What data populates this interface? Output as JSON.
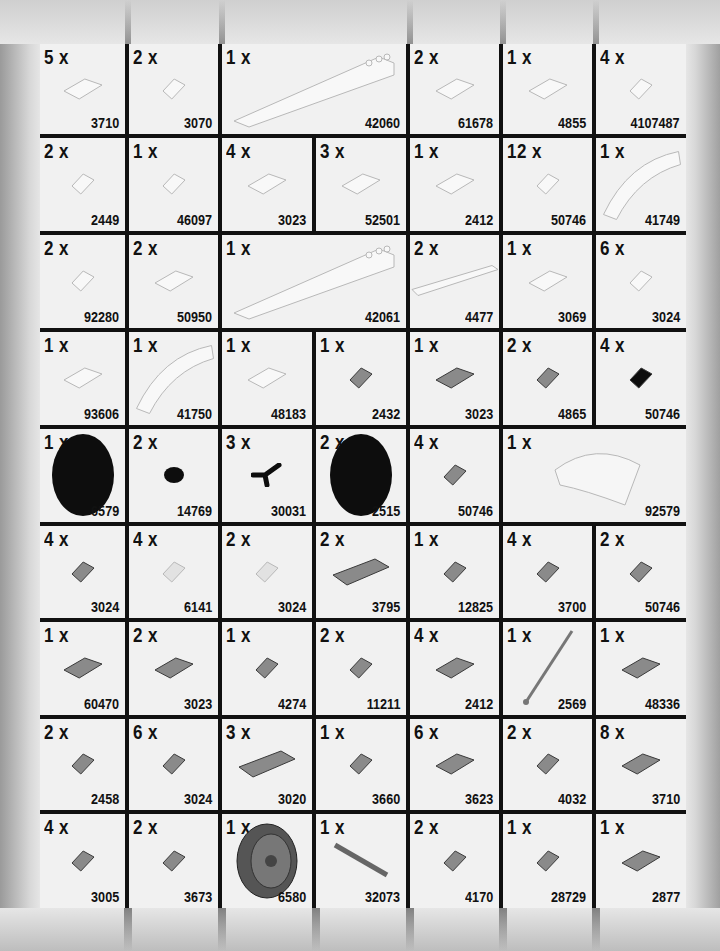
{
  "page": {
    "quantity_suffix": "x"
  },
  "colors": {
    "grid_line": "#111111",
    "cell_bg": "#f1f1f1",
    "white_part": "#f8f8f8",
    "gray_part": "#8a8a8a",
    "black_part": "#0d0d0d"
  },
  "rows": [
    {
      "cells": [
        {
          "qty": "5 x",
          "part": "3710",
          "color": "white",
          "shape": "plate-1x4",
          "span": 1
        },
        {
          "qty": "2 x",
          "part": "3070",
          "color": "white",
          "shape": "tile-1x1",
          "span": 1
        },
        {
          "qty": "1 x",
          "part": "42060",
          "color": "white",
          "shape": "wedge-long",
          "span": 2
        },
        {
          "qty": "2 x",
          "part": "61678",
          "color": "white",
          "shape": "curved-slope",
          "span": 1
        },
        {
          "qty": "1 x",
          "part": "4855",
          "color": "white",
          "shape": "wedge-inverted",
          "span": 1
        },
        {
          "qty": "4 x",
          "part": "4107487",
          "color": "white",
          "shape": "slope-small",
          "span": 1
        }
      ]
    },
    {
      "cells": [
        {
          "qty": "2 x",
          "part": "2449",
          "color": "white",
          "shape": "slope-inverted-tall",
          "span": 1
        },
        {
          "qty": "1  x",
          "part": "46097",
          "color": "white",
          "shape": "slope-printed",
          "span": 1
        },
        {
          "qty": "4 x",
          "part": "3023",
          "color": "white",
          "shape": "plate-1x2",
          "span": 1
        },
        {
          "qty": "3 x",
          "part": "52501",
          "color": "white",
          "shape": "slope-inverted-plate",
          "span": 1
        },
        {
          "qty": "1 x",
          "part": "2412",
          "color": "white",
          "shape": "grille",
          "span": 1
        },
        {
          "qty": "12 x",
          "part": "50746",
          "color": "white",
          "shape": "slope-1x1",
          "span": 1
        },
        {
          "qty": "1 x",
          "part": "41749",
          "color": "white",
          "shape": "wedge-curved",
          "span": 1
        }
      ]
    },
    {
      "cells": [
        {
          "qty": "2 x",
          "part": "92280",
          "color": "white",
          "shape": "plate-clip",
          "span": 1
        },
        {
          "qty": "2 x",
          "part": "50950",
          "color": "white",
          "shape": "curved-slope-small",
          "span": 1
        },
        {
          "qty": "1 x",
          "part": "42061",
          "color": "white",
          "shape": "wedge-long",
          "span": 2
        },
        {
          "qty": "2 x",
          "part": "4477",
          "color": "white",
          "shape": "plate-1x10",
          "span": 1
        },
        {
          "qty": "1 x",
          "part": "3069",
          "color": "white",
          "shape": "tile-1x2",
          "span": 1
        },
        {
          "qty": "6 x",
          "part": "3024",
          "color": "white",
          "shape": "plate-1x1",
          "span": 1
        }
      ]
    },
    {
      "cells": [
        {
          "qty": "1 x",
          "part": "93606",
          "color": "white",
          "shape": "curved-slope",
          "span": 1
        },
        {
          "qty": "1 x",
          "part": "41750",
          "color": "white",
          "shape": "wedge-curved",
          "span": 1
        },
        {
          "qty": "1 x",
          "part": "48183",
          "color": "white",
          "shape": "wedge-plate",
          "span": 1
        },
        {
          "qty": "1 x",
          "part": "2432",
          "color": "gray",
          "shape": "tile-handle",
          "span": 1
        },
        {
          "qty": "1 x",
          "part": "3023",
          "color": "gray",
          "shape": "plate-1x2",
          "span": 1
        },
        {
          "qty": "2 x",
          "part": "4865",
          "color": "gray",
          "shape": "panel",
          "span": 1
        },
        {
          "qty": "4 x",
          "part": "50746",
          "color": "black",
          "shape": "slope-1x1",
          "span": 1
        }
      ]
    },
    {
      "cells": [
        {
          "qty": "1 x",
          "part": "6579",
          "color": "black",
          "shape": "tire",
          "span": 1
        },
        {
          "qty": "2 x",
          "part": "14769",
          "color": "black",
          "shape": "tile-round",
          "span": 1
        },
        {
          "qty": "3 x",
          "part": "30031",
          "color": "black",
          "shape": "handlebars",
          "span": 1
        },
        {
          "qty": "2 x",
          "part": "2515",
          "color": "black",
          "shape": "tire",
          "span": 1
        },
        {
          "qty": "4 x",
          "part": "50746",
          "color": "gray",
          "shape": "slope-1x1",
          "span": 1
        },
        {
          "qty": "1 x",
          "part": "92579",
          "color": "white",
          "shape": "windscreen",
          "span": 2
        }
      ]
    },
    {
      "cells": [
        {
          "qty": "4 x",
          "part": "3024",
          "color": "gray",
          "shape": "plate-1x1",
          "span": 1
        },
        {
          "qty": "4 x",
          "part": "6141",
          "color": "trans-clear",
          "shape": "plate-round",
          "span": 1
        },
        {
          "qty": "2 x",
          "part": "3024",
          "color": "trans-clear",
          "shape": "plate-1x1",
          "span": 1
        },
        {
          "qty": "2 x",
          "part": "3795",
          "color": "gray",
          "shape": "plate-2x6",
          "span": 1
        },
        {
          "qty": "1 x",
          "part": "12825",
          "color": "gray",
          "shape": "tile-clip",
          "span": 1
        },
        {
          "qty": "4 x",
          "part": "3700",
          "color": "gray",
          "shape": "technic-brick",
          "span": 1
        },
        {
          "qty": "2 x",
          "part": "50746",
          "color": "gray",
          "shape": "slope-1x1",
          "span": 1
        }
      ]
    },
    {
      "cells": [
        {
          "qty": "1 x",
          "part": "60470",
          "color": "gray",
          "shape": "plate-clips",
          "span": 1
        },
        {
          "qty": "2 x",
          "part": "3023",
          "color": "gray",
          "shape": "plate-1x2",
          "span": 1
        },
        {
          "qty": "1 x",
          "part": "4274",
          "color": "gray",
          "shape": "technic-pin",
          "span": 1
        },
        {
          "qty": "2 x",
          "part": "11211",
          "color": "gray",
          "shape": "brick-studs-side",
          "span": 1
        },
        {
          "qty": "4 x",
          "part": "2412",
          "color": "gray",
          "shape": "grille",
          "span": 1
        },
        {
          "qty": "1 x",
          "part": "2569",
          "color": "gray",
          "shape": "antenna",
          "span": 1
        },
        {
          "qty": "1 x",
          "part": "48336",
          "color": "gray",
          "shape": "plate-handle",
          "span": 1
        }
      ]
    },
    {
      "cells": [
        {
          "qty": "2 x",
          "part": "2458",
          "color": "gray",
          "shape": "brick-pin",
          "span": 1
        },
        {
          "qty": "6 x",
          "part": "3024",
          "color": "gray",
          "shape": "plate-1x1",
          "span": 1
        },
        {
          "qty": "3 x",
          "part": "3020",
          "color": "gray",
          "shape": "plate-2x4",
          "span": 1
        },
        {
          "qty": "1 x",
          "part": "3660",
          "color": "gray",
          "shape": "slope-inverted",
          "span": 1
        },
        {
          "qty": "6 x",
          "part": "3623",
          "color": "gray",
          "shape": "plate-1x3",
          "span": 1
        },
        {
          "qty": "2 x",
          "part": "4032",
          "color": "gray",
          "shape": "plate-round-2x2",
          "span": 1
        },
        {
          "qty": "8 x",
          "part": "3710",
          "color": "gray",
          "shape": "plate-1x4",
          "span": 1
        }
      ]
    },
    {
      "cells": [
        {
          "qty": "4 x",
          "part": "3005",
          "color": "gray",
          "shape": "brick-1x1",
          "span": 1
        },
        {
          "qty": "2 x",
          "part": "3673",
          "color": "gray",
          "shape": "technic-pin",
          "span": 1
        },
        {
          "qty": "1 x",
          "part": "6580",
          "color": "gray",
          "shape": "wheel-rim",
          "span": 1
        },
        {
          "qty": "1 x",
          "part": "32073",
          "color": "gray",
          "shape": "axle",
          "span": 1
        },
        {
          "qty": "2 x",
          "part": "4170",
          "color": "gray",
          "shape": "brick-1x1-clip",
          "span": 1
        },
        {
          "qty": "1 x",
          "part": "28729",
          "color": "gray",
          "shape": "bar-clip",
          "span": 1
        },
        {
          "qty": "1 x",
          "part": "2877",
          "color": "gray",
          "shape": "brick-1x2-grille",
          "span": 1
        }
      ]
    }
  ]
}
